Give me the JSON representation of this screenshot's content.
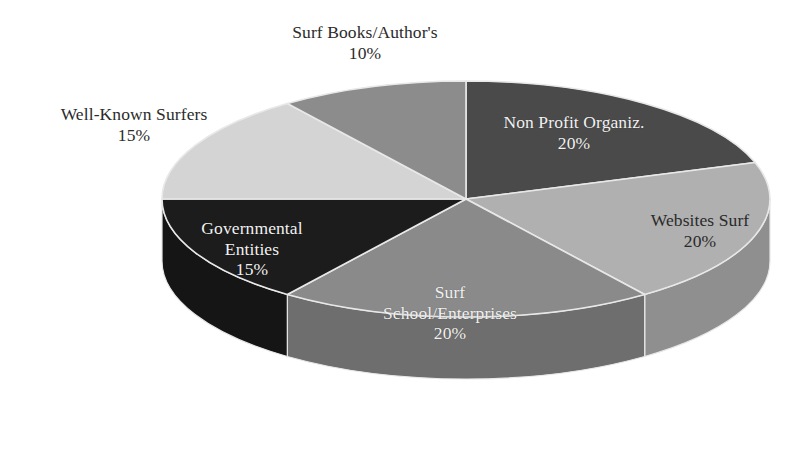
{
  "chart_data": {
    "type": "pie",
    "title": "",
    "subtitle": "",
    "xlabel": "",
    "ylabel": "",
    "legend_position": "none",
    "grid": false,
    "three_d": true,
    "start_angle_deg": 0,
    "direction": "clockwise",
    "value_unit": "percent",
    "total": 100,
    "categories": [
      "Non Profit Organiz.",
      "Websites Surf",
      "Surf School/Enterprises",
      "Governmental Entities",
      "Well-Known Surfers",
      "Surf Books/Author's"
    ],
    "values": [
      20,
      20,
      20,
      15,
      15,
      10
    ],
    "value_labels": [
      "20%",
      "20%",
      "20%",
      "15%",
      "15%",
      "10%"
    ],
    "colors": [
      "#4a4a4a",
      "#b0b0b0",
      "#8a8a8a",
      "#1c1c1c",
      "#d4d4d4",
      "#8c8c8c"
    ],
    "slices": [
      {
        "name": "Non Profit Organiz.",
        "value": 20,
        "percent_label": "20%",
        "color": "#4a4a4a",
        "side_color": "#3a3a3a",
        "start_angle_deg": 0,
        "end_angle_deg": 72,
        "label_placement": "inside",
        "label_text_color": "#f2f2f2",
        "label_lines": [
          "Non Profit Organiz.",
          "20%"
        ]
      },
      {
        "name": "Websites Surf",
        "value": 20,
        "percent_label": "20%",
        "color": "#b0b0b0",
        "side_color": "#8f8f8f",
        "start_angle_deg": 72,
        "end_angle_deg": 144,
        "label_placement": "inside",
        "label_text_color": "#2a2a2a",
        "label_lines": [
          "Websites Surf",
          "20%"
        ]
      },
      {
        "name": "Surf School/Enterprises",
        "value": 20,
        "percent_label": "20%",
        "color": "#8a8a8a",
        "side_color": "#6e6e6e",
        "start_angle_deg": 144,
        "end_angle_deg": 216,
        "label_placement": "inside",
        "label_text_color": "#f2f2f2",
        "label_lines": [
          "Surf",
          "School/Enterprises",
          "20%"
        ]
      },
      {
        "name": "Governmental Entities",
        "value": 15,
        "percent_label": "15%",
        "color": "#1c1c1c",
        "side_color": "#151515",
        "start_angle_deg": 216,
        "end_angle_deg": 270,
        "label_placement": "inside",
        "label_text_color": "#f2f2f2",
        "label_lines": [
          "Governmental",
          "Entities",
          "15%"
        ]
      },
      {
        "name": "Well-Known Surfers",
        "value": 15,
        "percent_label": "15%",
        "color": "#d4d4d4",
        "side_color": "#acacac",
        "start_angle_deg": 270,
        "end_angle_deg": 324,
        "label_placement": "outside",
        "label_text_color": "#2b2b2b",
        "label_lines": [
          "Well-Known Surfers",
          "15%"
        ]
      },
      {
        "name": "Surf Books/Author's",
        "value": 10,
        "percent_label": "10%",
        "color": "#8c8c8c",
        "side_color": "#707070",
        "start_angle_deg": 324,
        "end_angle_deg": 360,
        "label_placement": "outside",
        "label_text_color": "#2b2b2b",
        "label_lines": [
          "Surf Books/Author's",
          "10%"
        ]
      }
    ]
  },
  "labels": {
    "surf_books": {
      "line1": "Surf Books/Author's",
      "line2": "10%"
    },
    "well_known": {
      "line1": "Well-Known Surfers",
      "line2": "15%"
    },
    "non_profit": {
      "line1": "Non Profit Organiz.",
      "line2": "20%"
    },
    "websites": {
      "line1": "Websites Surf",
      "line2": "20%"
    },
    "governmental": {
      "line1": "Governmental",
      "line2": "Entities",
      "line3": "15%"
    },
    "surf_school": {
      "line1": "Surf",
      "line2": "School/Enterprises",
      "line3": "20%"
    }
  },
  "palette": {
    "background": "#ffffff",
    "outline": "#e8e8e8",
    "text_dark": "#2b2b2b",
    "text_light": "#f2f2f2"
  }
}
